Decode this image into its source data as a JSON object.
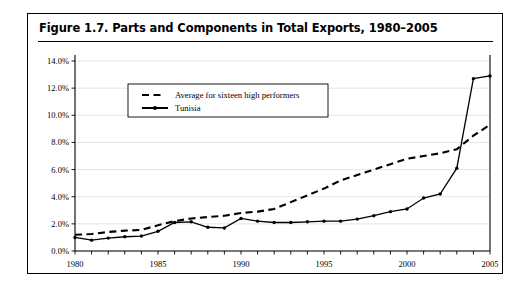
{
  "figure": {
    "title": "Figure 1.7.  Parts and Components in Total Exports, 1980–2005"
  },
  "chart_data": {
    "type": "line",
    "title": "Figure 1.7.  Parts and Components in Total Exports, 1980–2005",
    "xlabel": "",
    "ylabel": "",
    "xlim": [
      1980,
      2005
    ],
    "ylim": [
      0,
      14
    ],
    "yticks": [
      0,
      2,
      4,
      6,
      8,
      10,
      12,
      14
    ],
    "ytick_labels": [
      "0.0%",
      "2.0%",
      "4.0%",
      "6.0%",
      "8.0%",
      "10.0%",
      "12.0%",
      "14.0%"
    ],
    "xticks": [
      1980,
      1981,
      1982,
      1983,
      1984,
      1985,
      1986,
      1987,
      1988,
      1989,
      1990,
      1991,
      1992,
      1993,
      1994,
      1995,
      1996,
      1997,
      1998,
      1999,
      2000,
      2001,
      2002,
      2003,
      2004,
      2005
    ],
    "xtick_labels_shown": [
      "1980",
      "1985",
      "1990",
      "1995",
      "2000",
      "2005"
    ],
    "grid": true,
    "legend_position": "upper-left-inside",
    "x": [
      1980,
      1981,
      1982,
      1983,
      1984,
      1985,
      1986,
      1987,
      1988,
      1989,
      1990,
      1991,
      1992,
      1993,
      1994,
      1995,
      1996,
      1997,
      1998,
      1999,
      2000,
      2001,
      2002,
      2003,
      2004,
      2005
    ],
    "series": [
      {
        "name": "Average for sixteen high performers",
        "style": "dashed",
        "markers": false,
        "values": [
          1.2,
          1.25,
          1.4,
          1.5,
          1.55,
          1.9,
          2.2,
          2.4,
          2.5,
          2.6,
          2.8,
          2.9,
          3.1,
          3.6,
          4.1,
          4.6,
          5.2,
          5.6,
          6.0,
          6.4,
          6.8,
          7.0,
          7.2,
          7.5,
          8.5,
          9.3
        ]
      },
      {
        "name": "Tunisia",
        "style": "solid",
        "markers": true,
        "values": [
          1.0,
          0.8,
          0.95,
          1.05,
          1.1,
          1.45,
          2.1,
          2.15,
          1.75,
          1.7,
          2.4,
          2.2,
          2.1,
          2.1,
          2.15,
          2.2,
          2.2,
          2.35,
          2.6,
          2.9,
          3.1,
          3.9,
          4.2,
          6.1,
          12.7,
          12.9
        ]
      }
    ]
  }
}
